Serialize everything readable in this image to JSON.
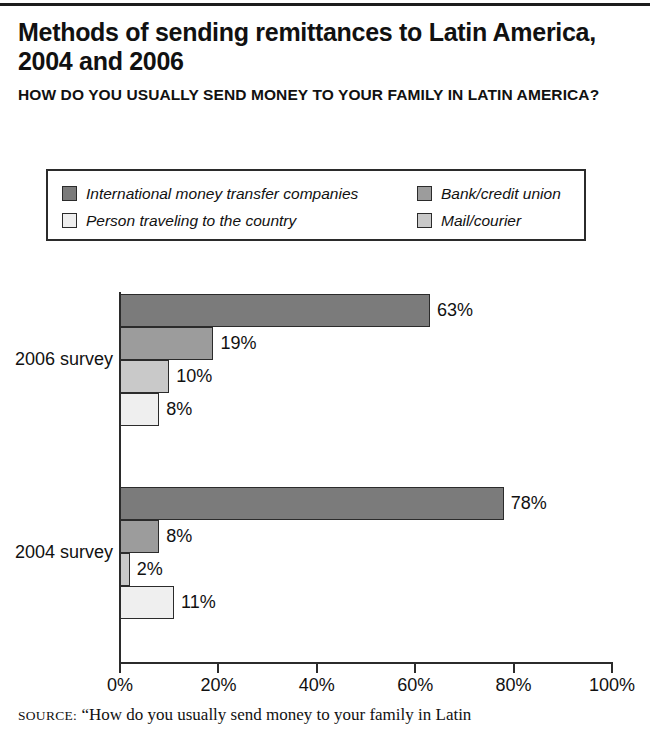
{
  "title": "Methods of sending remittances to Latin America, 2004 and 2006",
  "subtitle": "HOW DO YOU USUALLY SEND MONEY TO YOUR FAMILY IN LATIN AMERICA?",
  "source": {
    "kicker": "SOURCE:",
    "text": "“How do you usually send money to your family in Latin"
  },
  "colors": {
    "series_1": "#7b7b7b",
    "series_2": "#9c9c9c",
    "series_3": "#c9c9c9",
    "series_4": "#efefef",
    "outline": "#2b2b2b",
    "text": "#111111"
  },
  "chart_data": {
    "type": "bar",
    "orientation": "horizontal",
    "title": "Methods of sending remittances to Latin America, 2004 and 2006",
    "subtitle": "HOW DO YOU USUALLY SEND MONEY TO YOUR FAMILY IN LATIN AMERICA?",
    "xlabel": "",
    "ylabel": "",
    "xlim": [
      0,
      100
    ],
    "xticks": [
      0,
      20,
      40,
      60,
      80,
      100
    ],
    "xtick_labels": [
      "0%",
      "20%",
      "40%",
      "60%",
      "80%",
      "100%"
    ],
    "grid": false,
    "legend_position": "above-plot",
    "categories": [
      "2006 survey",
      "2004 survey"
    ],
    "series": [
      {
        "name": "International money transfer companies",
        "color": "#7b7b7b",
        "values": [
          63,
          78
        ],
        "labels": [
          "63%",
          "78%"
        ]
      },
      {
        "name": "Bank/credit union",
        "color": "#9c9c9c",
        "values": [
          19,
          8
        ],
        "labels": [
          "19%",
          "8%"
        ]
      },
      {
        "name": "Mail/courier",
        "color": "#c9c9c9",
        "values": [
          10,
          2
        ],
        "labels": [
          "10%",
          "2%"
        ]
      },
      {
        "name": "Person traveling to the country",
        "color": "#efefef",
        "values": [
          8,
          11
        ],
        "labels": [
          "8%",
          "11%"
        ]
      }
    ],
    "legend_entries": [
      {
        "label": "International money transfer companies",
        "color": "#7b7b7b"
      },
      {
        "label": "Bank/credit union",
        "color": "#9c9c9c"
      },
      {
        "label": "Person traveling to the country",
        "color": "#efefef"
      },
      {
        "label": "Mail/courier",
        "color": "#c9c9c9"
      }
    ]
  }
}
